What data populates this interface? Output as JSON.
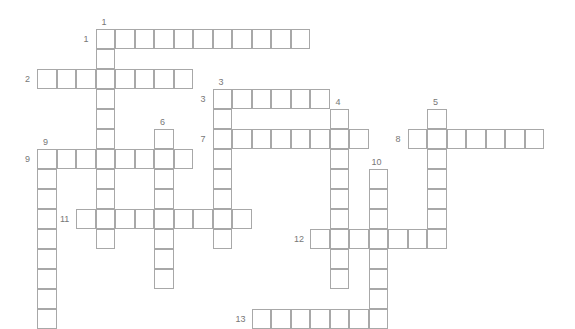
{
  "puzzle": {
    "type": "crossword",
    "grid_origin": {
      "x": 37,
      "y": 29
    },
    "cell_w": 19.5,
    "cell_h": 20,
    "line_color": "#a8a8a8",
    "label_color": "#777777",
    "entries": [
      {
        "number": "1",
        "direction": "across",
        "col": 3,
        "row": 0,
        "length": 11
      },
      {
        "number": "1",
        "direction": "down",
        "col": 3,
        "row": 0,
        "length": 11
      },
      {
        "number": "2",
        "direction": "across",
        "col": 0,
        "row": 2,
        "length": 8
      },
      {
        "number": "3",
        "direction": "across",
        "col": 9,
        "row": 3,
        "length": 6
      },
      {
        "number": "3",
        "direction": "down",
        "col": 9,
        "row": 3,
        "length": 8
      },
      {
        "number": "4",
        "direction": "down",
        "col": 15,
        "row": 4,
        "length": 9
      },
      {
        "number": "5",
        "direction": "down",
        "col": 20,
        "row": 4,
        "length": 7
      },
      {
        "number": "6",
        "direction": "down",
        "col": 6,
        "row": 5,
        "length": 8
      },
      {
        "number": "7",
        "direction": "across",
        "col": 9,
        "row": 5,
        "length": 8
      },
      {
        "number": "8",
        "direction": "across",
        "col": 19,
        "row": 5,
        "length": 7
      },
      {
        "number": "9",
        "direction": "across",
        "col": 0,
        "row": 6,
        "length": 8
      },
      {
        "number": "9",
        "direction": "down",
        "col": 0,
        "row": 6,
        "length": 9
      },
      {
        "number": "10",
        "direction": "down",
        "col": 17,
        "row": 7,
        "length": 8
      },
      {
        "number": "11",
        "direction": "across",
        "col": 2,
        "row": 9,
        "length": 9
      },
      {
        "number": "12",
        "direction": "across",
        "col": 14,
        "row": 10,
        "length": 7
      },
      {
        "number": "13",
        "direction": "across",
        "col": 11,
        "row": 14,
        "length": 7
      }
    ]
  }
}
